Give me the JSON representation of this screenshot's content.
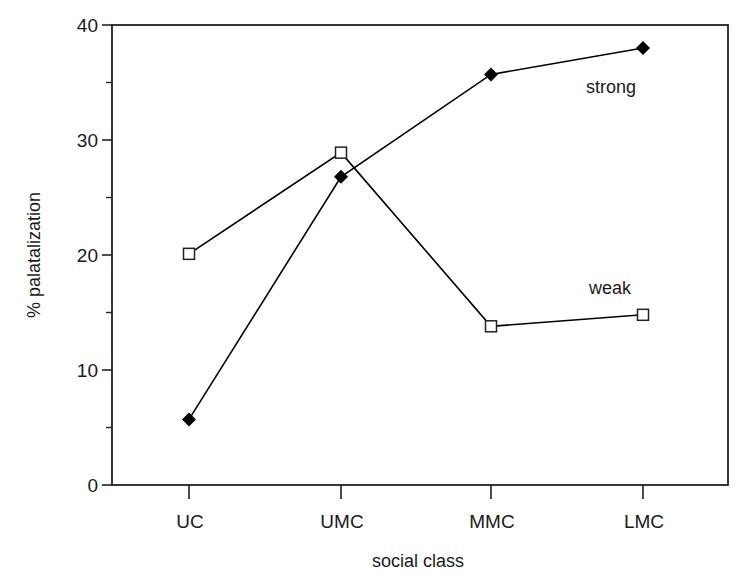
{
  "chart_data": {
    "type": "line",
    "title": "",
    "xlabel": "social class",
    "ylabel": "% palatalization",
    "categories": [
      "UC",
      "UMC",
      "MMC",
      "LMC"
    ],
    "series": [
      {
        "name": "strong",
        "marker": "filled-diamond",
        "color": "#000000",
        "values": [
          5.7,
          26.8,
          35.7,
          38.0
        ]
      },
      {
        "name": "weak",
        "marker": "open-square",
        "color": "#000000",
        "values": [
          20.1,
          28.9,
          13.8,
          14.8
        ]
      }
    ],
    "ylim": [
      0,
      40
    ],
    "yticks": [
      0,
      10,
      20,
      30,
      40
    ],
    "yminor_ticks": [
      5,
      15,
      25,
      35
    ],
    "grid": false,
    "legend": "inline labels near series ends"
  },
  "labels": {
    "xlabel": "social class",
    "ylabel": "% palatalization",
    "strong": "strong",
    "weak": "weak",
    "yticks": [
      "0",
      "10",
      "20",
      "30",
      "40"
    ],
    "xticks": [
      "UC",
      "UMC",
      "MMC",
      "LMC"
    ]
  }
}
